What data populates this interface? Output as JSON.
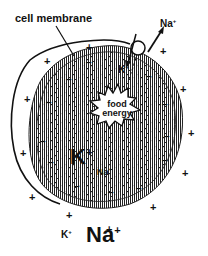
{
  "diagram": {
    "labels": {
      "cell_membrane": "cell membrane",
      "pump_na_out": "Na",
      "pump_na_out_sup": "+",
      "pump_k_in": "K",
      "pump_k_in_sup": "+",
      "food_energy_line1": "food",
      "food_energy_line2": "energy",
      "inside_k": "K",
      "inside_k_sup": "+",
      "inside_na": "Na",
      "inside_na_sup": "+",
      "outside_k": "K",
      "outside_k_sup": "+",
      "outside_na": "Na",
      "outside_na_sup": "+"
    },
    "charges": {
      "outside_symbol": "+",
      "inside_symbol": "−",
      "outside_positions": [
        [
          44,
          56
        ],
        [
          24,
          94
        ],
        [
          20,
          148
        ],
        [
          29,
          192
        ],
        [
          66,
          210
        ],
        [
          106,
          224
        ],
        [
          150,
          202
        ],
        [
          182,
          168
        ],
        [
          188,
          128
        ],
        [
          180,
          84
        ],
        [
          160,
          46
        ],
        [
          86,
          42
        ]
      ],
      "inside_positions": [
        [
          86,
          58
        ],
        [
          66,
          75
        ],
        [
          46,
          98
        ],
        [
          40,
          137
        ],
        [
          48,
          158
        ],
        [
          74,
          182
        ],
        [
          108,
          188
        ],
        [
          136,
          184
        ],
        [
          162,
          156
        ],
        [
          164,
          132
        ],
        [
          162,
          100
        ],
        [
          146,
          72
        ]
      ]
    },
    "colors": {
      "ink": "#111111",
      "background": "#ffffff",
      "membrane": "#333333"
    }
  }
}
